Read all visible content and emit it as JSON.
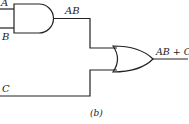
{
  "diagram": {
    "inputs": {
      "a": "A",
      "b": "B",
      "c": "C"
    },
    "and_gate": {
      "output_label": "AB"
    },
    "or_gate": {
      "output_label": "AB + C"
    },
    "caption": "(b)",
    "stroke_color": "#222222"
  }
}
